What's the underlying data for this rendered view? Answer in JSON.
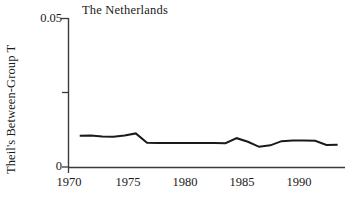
{
  "chart_data": {
    "type": "line",
    "title": "The Netherlands",
    "xlabel": "",
    "ylabel": "Theil's Between-Group T",
    "xlim": [
      1969.0,
      1993.3
    ],
    "ylim": [
      0,
      0.05
    ],
    "grid": false,
    "legend": null,
    "y_ticks": [
      {
        "value": 0.05,
        "label": "0.05"
      },
      {
        "value": 0.025,
        "label": ""
      },
      {
        "value": 0,
        "label": "0"
      }
    ],
    "x_ticks": [
      {
        "value": 1970,
        "label": "1970"
      },
      {
        "value": 1975,
        "label": "1975"
      },
      {
        "value": 1980,
        "label": "1980"
      },
      {
        "value": 1985,
        "label": "1985"
      },
      {
        "value": 1990,
        "label": "1990"
      }
    ],
    "series": [
      {
        "name": "Theil's Between-Group T",
        "color": "#1a1a1a",
        "x": [
          1970,
          1971,
          1972,
          1973,
          1974,
          1975,
          1976,
          1977,
          1978,
          1979,
          1980,
          1981,
          1982,
          1983,
          1984,
          1985,
          1986,
          1987,
          1988,
          1989,
          1990,
          1991,
          1992,
          1993
        ],
        "values": [
          0.0105,
          0.0106,
          0.0103,
          0.0102,
          0.0106,
          0.0113,
          0.0082,
          0.0081,
          0.0081,
          0.0081,
          0.0081,
          0.0081,
          0.0081,
          0.008,
          0.0097,
          0.0085,
          0.0068,
          0.0073,
          0.0087,
          0.0089,
          0.0089,
          0.0088,
          0.0074,
          0.0075
        ]
      }
    ]
  },
  "axes": {
    "axis_color": "#3a3a3a",
    "line_color": "#1a1a1a"
  }
}
